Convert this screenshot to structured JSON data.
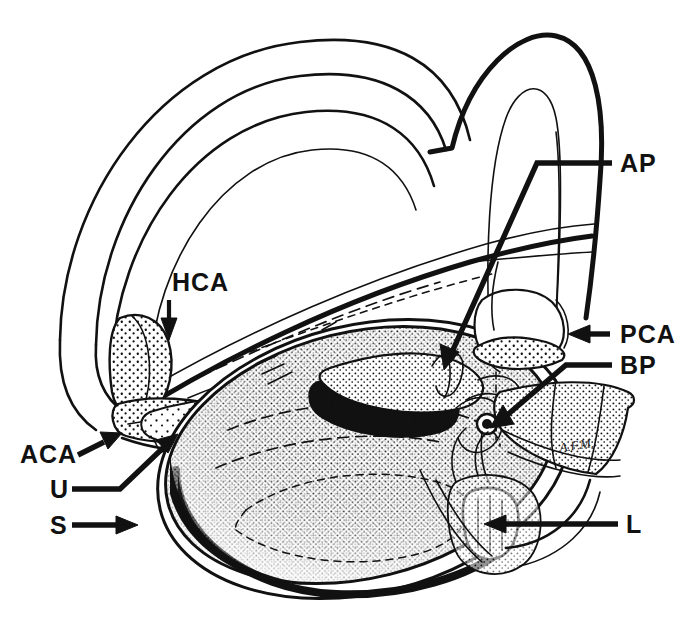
{
  "figure": {
    "type": "anatomical-line-drawing",
    "background_color": "#ffffff",
    "ink_color": "#111111",
    "width": 690,
    "height": 644
  },
  "labels": [
    {
      "key": "HCA",
      "text": "HCA",
      "name": "label-hca",
      "x": 172,
      "y": 291,
      "leader": "short-arrow-down",
      "points_to": "horizontal canal ampulla"
    },
    {
      "key": "AP",
      "text": "AP",
      "name": "label-ap",
      "x": 620,
      "y": 170,
      "leader": "elbow-left-down-arrow",
      "points_to": "anterior/posterior ampulla"
    },
    {
      "key": "PCA",
      "text": "PCA",
      "name": "label-pca",
      "x": 620,
      "y": 341,
      "leader": "horizontal-arrow-left",
      "points_to": "posterior canal ampulla"
    },
    {
      "key": "BP",
      "text": "BP",
      "name": "label-bp",
      "x": 620,
      "y": 372,
      "leader": "elbow-left-down-arrow",
      "points_to": "basilar papilla"
    },
    {
      "key": "ACA",
      "text": "ACA",
      "name": "label-aca",
      "x": 22,
      "y": 461,
      "leader": "diagonal-arrow-up-right",
      "points_to": "anterior canal ampulla"
    },
    {
      "key": "U",
      "text": "U",
      "name": "label-u",
      "x": 52,
      "y": 496,
      "leader": "elbow-right-up-arrow",
      "points_to": "utricle"
    },
    {
      "key": "S",
      "text": "S",
      "name": "label-s",
      "x": 52,
      "y": 533,
      "leader": "horizontal-arrow-right",
      "points_to": "saccule"
    },
    {
      "key": "L",
      "text": "L",
      "name": "label-l",
      "x": 628,
      "y": 531,
      "leader": "long-horizontal-arrow-left",
      "points_to": "lagena"
    }
  ],
  "signature": {
    "text": "A.F.M.",
    "x": 560,
    "y": 452
  },
  "legend_note": ""
}
